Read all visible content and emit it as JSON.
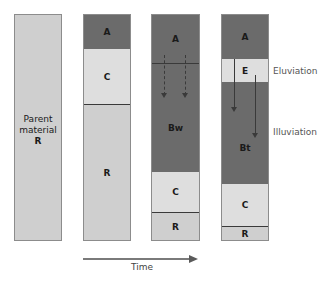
{
  "profiles": [
    {
      "id": "parent",
      "horizons": [
        {
          "label_line1": "Parent",
          "label_line2": "material",
          "label": "R",
          "tone": "mid"
        }
      ]
    },
    {
      "id": "stage1",
      "horizons": [
        {
          "label": "A",
          "tone": "dark"
        },
        {
          "label": "C",
          "tone": "light"
        },
        {
          "label": "R",
          "tone": "mid"
        }
      ]
    },
    {
      "id": "stage2",
      "horizons": [
        {
          "label": "A",
          "tone": "dark"
        },
        {
          "label": "Bw",
          "tone": "dark"
        },
        {
          "label": "C",
          "tone": "light"
        },
        {
          "label": "R",
          "tone": "mid"
        }
      ]
    },
    {
      "id": "stage3",
      "horizons": [
        {
          "label": "A",
          "tone": "dark"
        },
        {
          "label": "E",
          "tone": "light"
        },
        {
          "label": "Bt",
          "tone": "dark"
        },
        {
          "label": "C",
          "tone": "light"
        },
        {
          "label": "R",
          "tone": "mid"
        }
      ]
    }
  ],
  "annotations": {
    "eluviation": "Eluviation",
    "illuviation": "Illuviation"
  },
  "axis": {
    "label": "Time"
  },
  "colors": {
    "dark": "#6b6b6b",
    "light": "#dedede",
    "mid": "#cfcfcf",
    "border": "#8c8c8c"
  }
}
